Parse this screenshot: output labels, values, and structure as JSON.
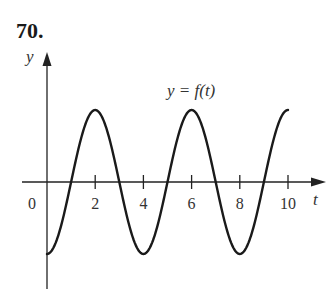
{
  "problem": {
    "number": "70."
  },
  "chart_data": {
    "type": "line",
    "title": "",
    "curve_label": "y = f(t)",
    "xlabel": "t",
    "ylabel": "y",
    "origin_label": "0",
    "x_ticks": [
      2,
      4,
      6,
      8,
      10
    ],
    "x_tick_labels": [
      "2",
      "4",
      "6",
      "8",
      "10"
    ],
    "xlim": [
      0,
      10
    ],
    "function": "-A*cos(pi*t/2)",
    "period": 4,
    "x": [
      0,
      1,
      2,
      3,
      4,
      5,
      6,
      7,
      8,
      9,
      10
    ],
    "values": [
      -1,
      0,
      1,
      0,
      -1,
      0,
      1,
      0,
      -1,
      0,
      1
    ],
    "maxima_t": [
      2,
      6,
      10
    ],
    "minima_t": [
      0,
      4,
      8
    ],
    "zeros_t": [
      1,
      3,
      5,
      7,
      9
    ],
    "grid": false,
    "legend": "none"
  }
}
